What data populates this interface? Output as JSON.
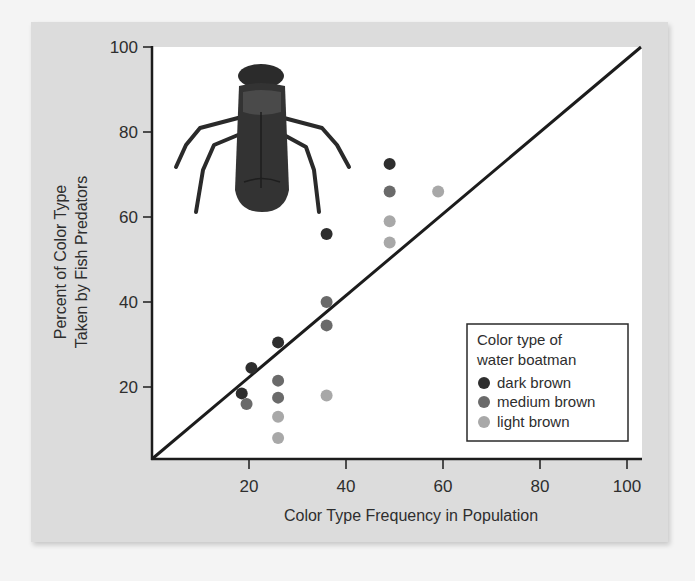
{
  "chart_data": {
    "type": "scatter",
    "title": "",
    "xlabel": "Color Type Frequency in Population",
    "ylabel_lines": [
      "Percent of Color Type",
      "Taken by Fish Predators"
    ],
    "ylabel": "Percent of Color Type Taken by Fish Predators",
    "xlim": [
      0,
      100
    ],
    "ylim": [
      0,
      100
    ],
    "x_ticks": [
      20,
      40,
      60,
      80,
      100
    ],
    "y_ticks": [
      20,
      40,
      60,
      80,
      100
    ],
    "grid": false,
    "reference_line": {
      "label": "y = x",
      "from": [
        0,
        0
      ],
      "to": [
        100,
        100
      ]
    },
    "legend": {
      "title_lines": [
        "Color type of",
        "water boatman"
      ],
      "position": "lower right"
    },
    "series": [
      {
        "name": "dark brown",
        "color": "#2e2e2e",
        "points": [
          [
            18.5,
            18.5
          ],
          [
            20.5,
            24.5
          ],
          [
            26,
            30.5
          ],
          [
            36,
            56
          ],
          [
            49,
            72.5
          ]
        ]
      },
      {
        "name": "medium brown",
        "color": "#6a6a6a",
        "points": [
          [
            19.5,
            16
          ],
          [
            26,
            21.5
          ],
          [
            26,
            17.5
          ],
          [
            36,
            40
          ],
          [
            36,
            34.5
          ],
          [
            49,
            66
          ]
        ]
      },
      {
        "name": "light brown",
        "color": "#a8a8a8",
        "points": [
          [
            26,
            13
          ],
          [
            26,
            8
          ],
          [
            36,
            18
          ],
          [
            49,
            59
          ],
          [
            49,
            54
          ],
          [
            59,
            66
          ]
        ]
      }
    ],
    "illustration": "water boatman insect"
  }
}
